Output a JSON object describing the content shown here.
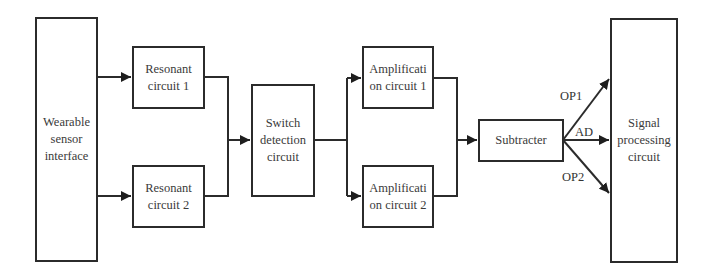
{
  "diagram": {
    "type": "block-diagram",
    "colors": {
      "stroke": "#2b2b2b",
      "text": "#3a3a3a",
      "background": "#ffffff"
    },
    "blocks": {
      "wearable": {
        "label": "Wearable\nsensor\ninterface"
      },
      "resonant1": {
        "label": "Resonant\ncircuit 1"
      },
      "resonant2": {
        "label": "Resonant\ncircuit 2"
      },
      "switch": {
        "label": "Switch\ndetection\ncircuit"
      },
      "amp1": {
        "label": "Amplificati\non circuit 1"
      },
      "amp2": {
        "label": "Amplificati\non circuit 2"
      },
      "subtracter": {
        "label": "Subtracter"
      },
      "signal": {
        "label": "Signal\nprocessing\ncircuit"
      }
    },
    "edge_labels": {
      "op1": "OP1",
      "ad": "AD",
      "op2": "OP2"
    },
    "edges": [
      {
        "from": "Wearable sensor interface",
        "to": "Resonant circuit 1"
      },
      {
        "from": "Wearable sensor interface",
        "to": "Resonant circuit 2"
      },
      {
        "from": "Resonant circuit 1",
        "to": "Switch detection circuit"
      },
      {
        "from": "Resonant circuit 2",
        "to": "Switch detection circuit"
      },
      {
        "from": "Switch detection circuit",
        "to": "Amplification circuit 1"
      },
      {
        "from": "Switch detection circuit",
        "to": "Amplification circuit 2"
      },
      {
        "from": "Amplification circuit 1",
        "to": "Subtracter"
      },
      {
        "from": "Amplification circuit 2",
        "to": "Subtracter"
      },
      {
        "from": "Subtracter",
        "to": "Signal processing circuit",
        "label": "OP1"
      },
      {
        "from": "Subtracter",
        "to": "Signal processing circuit",
        "label": "AD"
      },
      {
        "from": "Subtracter",
        "to": "Signal processing circuit",
        "label": "OP2"
      }
    ]
  }
}
